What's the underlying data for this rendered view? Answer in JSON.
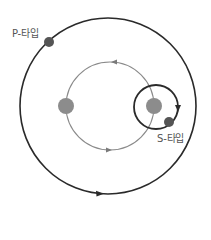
{
  "diagram": {
    "type": "binary-star planetary orbits",
    "labels": {
      "p_type": "P-타입",
      "s_type": "S-타입"
    },
    "colors": {
      "background": "#ffffff",
      "outer_orbit": "#2a2a2a",
      "binary_orbit": "#8a8a8a",
      "stars": "#8c8c8c",
      "planets": "#555555",
      "label_text": "#555555"
    },
    "elements": {
      "outer_orbit": {
        "cx": 108,
        "cy": 106,
        "r": 88,
        "direction": "clockwise"
      },
      "binary_orbit": {
        "cx": 110,
        "cy": 106,
        "r": 44,
        "direction": "counter-clockwise"
      },
      "star_left": {
        "cx": 66,
        "cy": 106,
        "r": 8
      },
      "star_right": {
        "cx": 154,
        "cy": 106,
        "r": 8
      },
      "s_orbit": {
        "cx": 156,
        "cy": 107,
        "r": 22,
        "direction": "clockwise"
      },
      "p_planet": {
        "cx": 49,
        "cy": 42,
        "r": 5
      },
      "s_planet": {
        "cx": 169,
        "cy": 120,
        "r": 5
      }
    }
  }
}
